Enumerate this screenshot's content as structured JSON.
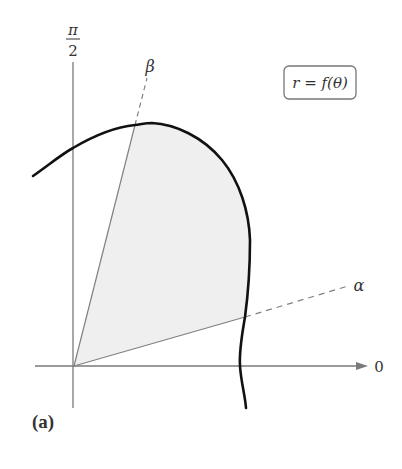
{
  "diagram": {
    "type": "polar-region",
    "axis_labels": {
      "vertical_top": {
        "numerator": "π",
        "denominator": "2"
      },
      "horizontal_right": "0"
    },
    "rays": [
      {
        "name": "beta",
        "label": "β"
      },
      {
        "name": "alpha",
        "label": "α"
      }
    ],
    "curve_label": "r = f(θ)",
    "caption": "(a)",
    "colors": {
      "region_fill": "#efefef",
      "axis": "#7a7a7a",
      "curve": "#111111",
      "ray": "#808080"
    }
  }
}
